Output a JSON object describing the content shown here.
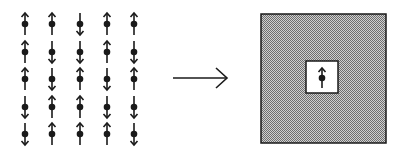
{
  "diagram": {
    "lattice": {
      "rows": 5,
      "cols": 5,
      "spins": [
        [
          "up",
          "up",
          "down",
          "up",
          "up"
        ],
        [
          "up",
          "down",
          "down",
          "up",
          "down"
        ],
        [
          "up",
          "down",
          "up",
          "down",
          "up"
        ],
        [
          "down",
          "up",
          "up",
          "down",
          "down"
        ],
        [
          "down",
          "up",
          "up",
          "up",
          "down"
        ]
      ]
    },
    "transform_arrow": "right",
    "block": {
      "fill": "dithered-gray",
      "center_spin": "up"
    },
    "colors": {
      "ink": "#1a1a1a",
      "block_fill_dark": "#777777",
      "block_fill_light": "#d0d0d0",
      "background": "#ffffff"
    }
  }
}
